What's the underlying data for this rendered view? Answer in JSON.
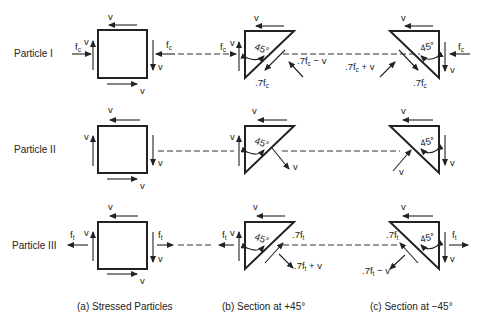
{
  "rows": [
    {
      "label": "Particle I",
      "stress": "f",
      "stress_sub": "c"
    },
    {
      "label": "Particle II"
    },
    {
      "label": "Particle III",
      "stress": "f",
      "stress_sub": "t"
    }
  ],
  "symbols": {
    "v": "v",
    "angle": "45°",
    "row1_b_normal": ".7f",
    "row1_b_normal_sub": "c",
    "row1_b_resultant": ".7f",
    "row1_b_resultant_sub": "c",
    "row1_b_resultant_tail": " − v",
    "row1_c_normal": ".7f",
    "row1_c_normal_sub": "c",
    "row1_c_resultant": ".7f",
    "row1_c_resultant_sub": "c",
    "row1_c_resultant_tail": " + v",
    "row3_b_normal": ".7f",
    "row3_b_normal_sub": "t",
    "row3_b_resultant": ".7f",
    "row3_b_resultant_sub": "t",
    "row3_b_resultant_tail": " + v",
    "row3_c_normal": ".7f",
    "row3_c_normal_sub": "t",
    "row3_c_resultant": ".7f",
    "row3_c_resultant_sub": "t",
    "row3_c_resultant_tail": " − v"
  },
  "captions": {
    "a": "(a) Stressed Particles",
    "b": "(b) Section at  +45°",
    "c": "(c) Section at  −45°"
  }
}
